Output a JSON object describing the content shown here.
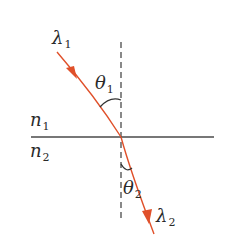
{
  "diagram": {
    "colors": {
      "ray": "#e0502a",
      "line": "#444444",
      "normal": "#444444",
      "text": "#2a2a2a",
      "background": "#ffffff"
    },
    "labels": {
      "lambda1": {
        "symbol": "λ",
        "sub": "1"
      },
      "lambda2": {
        "symbol": "λ",
        "sub": "2"
      },
      "theta1": {
        "symbol": "θ",
        "sub": "1"
      },
      "theta2": {
        "symbol": "θ",
        "sub": "2"
      },
      "n1": {
        "symbol": "n",
        "sub": "1"
      },
      "n2": {
        "symbol": "n",
        "sub": "2"
      }
    },
    "geometry": {
      "interface_y": 137,
      "interface_x_start": 31,
      "interface_x_end": 214,
      "normal_x": 121,
      "normal_y_start": 42,
      "normal_y_end": 222,
      "incident_start": [
        57,
        52
      ],
      "incident_end": [
        121,
        137
      ],
      "refracted_start": [
        121,
        137
      ],
      "refracted_end": [
        154,
        234
      ]
    }
  }
}
